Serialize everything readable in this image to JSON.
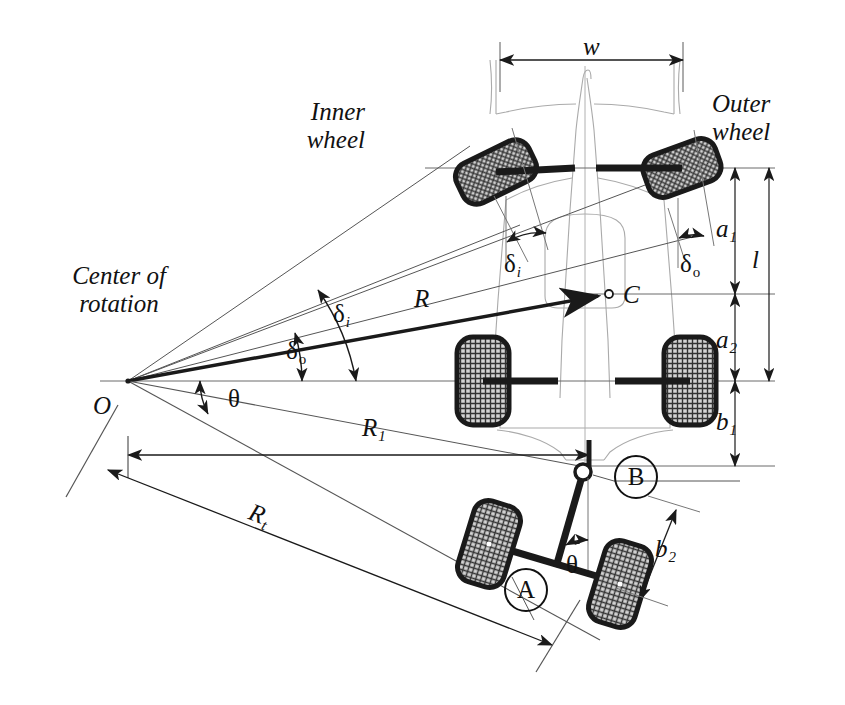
{
  "figure": {
    "type": "engineering-diagram"
  },
  "labels": {
    "inner_wheel": "Inner\nwheel",
    "inner_wheel_l1": "Inner",
    "inner_wheel_l2": "wheel",
    "outer_wheel_l1": "Outer",
    "outer_wheel_l2": "wheel",
    "center_of_rotation_l1": "Center of",
    "center_of_rotation_l2": "rotation",
    "width_w": "w",
    "length_l": "l",
    "a1": "a",
    "a1_sub": "1",
    "a2": "a",
    "a2_sub": "2",
    "b1": "b",
    "b1_sub": "1",
    "b2": "b",
    "b2_sub": "2",
    "radius_R": "R",
    "R1": "R",
    "R1_sub": "1",
    "Rt": "R",
    "Rt_sub": "t",
    "point_C": "C",
    "point_O": "O",
    "delta_i": "δ",
    "delta_i_sub": "i",
    "delta_o": "δ",
    "delta_o_sub": "o",
    "theta": "θ",
    "marker_A": "A",
    "marker_B": "B"
  },
  "annotations": [
    {
      "name": "delta-i-front",
      "symbol": "δ",
      "subscript": "i",
      "meaning": "inner wheel steer angle at front axle"
    },
    {
      "name": "delta-o-front",
      "symbol": "δ",
      "subscript": "o",
      "meaning": "outer wheel steer angle at front axle"
    },
    {
      "name": "delta-i-center",
      "symbol": "δ",
      "subscript": "i",
      "meaning": "inner steer angle measured at center of rotation"
    },
    {
      "name": "delta-o-center",
      "symbol": "δ",
      "subscript": "o",
      "meaning": "outer steer angle measured at center of rotation"
    },
    {
      "name": "theta-center",
      "symbol": "θ",
      "meaning": "articulation angle at center of rotation"
    },
    {
      "name": "theta-trailer",
      "symbol": "θ",
      "meaning": "trailer articulation angle at hitch"
    }
  ],
  "markers": {
    "A": {
      "label": "A",
      "meaning": "trailer axle"
    },
    "B": {
      "label": "B",
      "meaning": "hitch point"
    }
  },
  "colors": {
    "line": "#1a1a1a",
    "thin": "#555555",
    "ghost": "#9a9a9a",
    "tire_dark": "#2b2b2b",
    "tire_light": "#d8d8d8",
    "background": "#ffffff"
  }
}
